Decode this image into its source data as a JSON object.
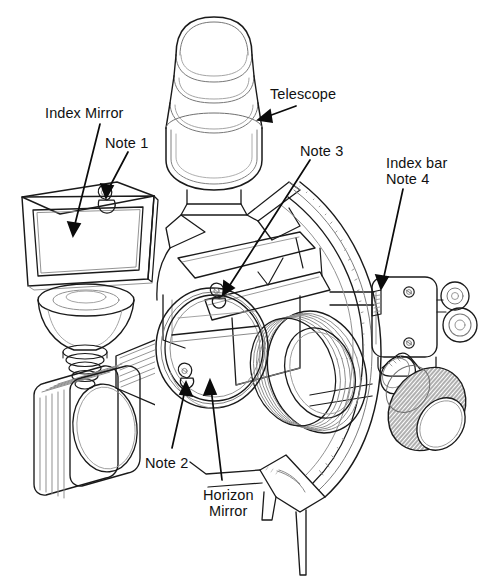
{
  "diagram": {
    "background_color": "#ffffff",
    "line_color": "#1a1a1a",
    "shade_color": "#8a8a8a",
    "text_color": "#111111",
    "labels": [
      {
        "id": "index-mirror",
        "text": "Index Mirror",
        "x": 45,
        "y": 105,
        "leader": [
          [
            100,
            124
          ],
          [
            72,
            232
          ]
        ]
      },
      {
        "id": "note-1",
        "text": "Note 1",
        "x": 105,
        "y": 135,
        "leader": [
          [
            128,
            153
          ],
          [
            107,
            197
          ]
        ]
      },
      {
        "id": "telescope",
        "text": "Telescope",
        "x": 270,
        "y": 86,
        "leader": [
          [
            300,
            107
          ],
          [
            258,
            119
          ]
        ]
      },
      {
        "id": "note-3",
        "text": "Note 3",
        "x": 300,
        "y": 143,
        "leader": [
          [
            312,
            161
          ],
          [
            222,
            295
          ]
        ]
      },
      {
        "id": "index-bar",
        "text": "Index bar",
        "x": 386,
        "y": 155,
        "leader": [
          [
            404,
            190
          ],
          [
            381,
            290
          ]
        ]
      },
      {
        "id": "note-4",
        "text": "Note 4",
        "x": 386,
        "y": 171,
        "leader": null
      },
      {
        "id": "note-2",
        "text": "Note 2",
        "x": 145,
        "y": 455,
        "leader": [
          [
            172,
            451
          ],
          [
            184,
            382
          ]
        ]
      },
      {
        "id": "horizon-mirror",
        "text": "Horizon",
        "x": 203,
        "y": 487,
        "leader": [
          [
            222,
            483
          ],
          [
            210,
            380
          ]
        ]
      },
      {
        "id": "horizon-mirror-2",
        "text": "Mirror",
        "x": 209,
        "y": 503,
        "leader": null
      }
    ],
    "parts": [
      {
        "name": "telescope",
        "description": "cylindrical sighting telescope with stacked barrel rings, top centre"
      },
      {
        "name": "index-mirror",
        "description": "rectangular mirror in perspective frame with top clip, upper left"
      },
      {
        "name": "horizon-mirror",
        "description": "circular horizon mirror with horizontal split line and two clips, centre"
      },
      {
        "name": "index-bar",
        "description": "index arm plate with two screws and rollers, right side"
      },
      {
        "name": "micrometer-drum",
        "description": "knurled micrometer drum, lower right"
      },
      {
        "name": "graduated-arc",
        "description": "graduated limb arc with tick marks, right of centre"
      },
      {
        "name": "shade-filters",
        "description": "stack of six rounded square shade glasses, lower left"
      },
      {
        "name": "frame",
        "description": "triangular braced frame connecting arc to mirrors"
      },
      {
        "name": "leg",
        "description": "support leg at bottom"
      }
    ]
  }
}
